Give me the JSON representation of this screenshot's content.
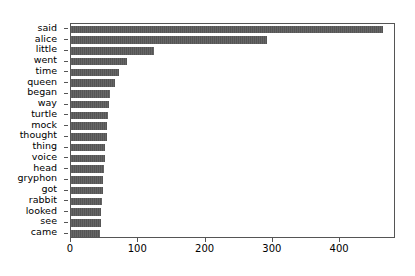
{
  "chart_data": {
    "type": "bar",
    "orientation": "horizontal",
    "title": "",
    "xlabel": "",
    "ylabel": "",
    "categories": [
      "said",
      "alice",
      "little",
      "went",
      "time",
      "queen",
      "began",
      "way",
      "turtle",
      "mock",
      "thought",
      "thing",
      "voice",
      "head",
      "gryphon",
      "got",
      "rabbit",
      "looked",
      "see",
      "came"
    ],
    "values": [
      464,
      291,
      123,
      83,
      71,
      65,
      58,
      56,
      55,
      54,
      53,
      51,
      50,
      49,
      48,
      47,
      46,
      45,
      44,
      43
    ],
    "xlim": [
      0,
      483
    ],
    "xticks": [
      0,
      100,
      200,
      300,
      400
    ],
    "xtick_labels": [
      "0",
      "100",
      "200",
      "300",
      "400"
    ],
    "grid": false,
    "legend": false,
    "bar_color": "#555555",
    "frame_color": "#555555",
    "background_color": "#ffffff"
  }
}
